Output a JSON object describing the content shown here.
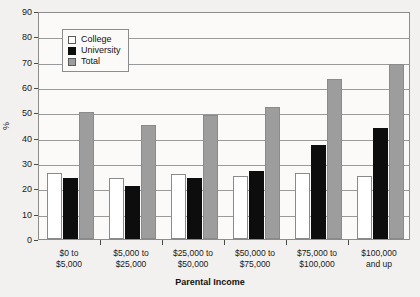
{
  "chart_data": {
    "type": "bar",
    "title": "",
    "xlabel": "Parental Income",
    "ylabel": "%",
    "ylim": [
      0,
      90
    ],
    "yticks": [
      0,
      10,
      20,
      30,
      40,
      50,
      60,
      70,
      80,
      90
    ],
    "grid": true,
    "legend_position": "top-left-inside",
    "categories": [
      "$0 to\n$5,000",
      "$5,000 to\n$25,000",
      "$25,000 to\n$50,000",
      "$50,000 to\n$75,000",
      "$75,000 to\n$100,000",
      "$100,000\nand up"
    ],
    "category_lines": [
      [
        "$0 to",
        "$5,000"
      ],
      [
        "$5,000 to",
        "$25,000"
      ],
      [
        "$25,000 to",
        "$50,000"
      ],
      [
        "$50,000 to",
        "$75,000"
      ],
      [
        "$75,000 to",
        "$100,000"
      ],
      [
        "$100,000",
        "and up"
      ]
    ],
    "series": [
      {
        "name": "College",
        "color": "#ffffff",
        "values": [
          26,
          24,
          25.5,
          25,
          26,
          25
        ]
      },
      {
        "name": "University",
        "color": "#0d0d0d",
        "values": [
          24,
          21,
          24,
          27,
          37,
          44
        ]
      },
      {
        "name": "Total",
        "color": "#9d9d9d",
        "values": [
          50,
          45,
          49,
          52,
          63,
          69
        ]
      }
    ]
  },
  "legend": {
    "items": [
      {
        "label": "College"
      },
      {
        "label": "University"
      },
      {
        "label": "Total"
      }
    ]
  },
  "axes": {
    "y_title": "%",
    "x_title": "Parental Income"
  }
}
